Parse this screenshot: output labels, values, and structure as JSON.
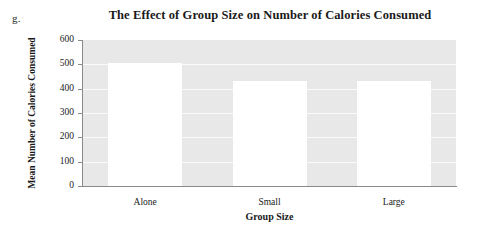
{
  "figure": {
    "item_marker": "g."
  },
  "chart_data": {
    "type": "bar",
    "title": "The Effect of Group Size on Number of Calories Consumed",
    "xlabel": "Group Size",
    "ylabel": "Mean Number of Calories Consumed",
    "categories": [
      "Alone",
      "Small",
      "Large"
    ],
    "values": [
      505,
      430,
      430
    ],
    "ylim": [
      0,
      600
    ],
    "ytick_labels": [
      "0",
      "100",
      "200",
      "300",
      "400",
      "500",
      "600"
    ],
    "ytick_values": [
      0,
      100,
      200,
      300,
      400,
      500,
      600
    ],
    "grid": true,
    "legend": "none",
    "colors": {
      "bar_fill": "#ffffff",
      "plot_background": "#e8e8e8",
      "gridline": "#fbfbfb",
      "axis_line": "#8a8a8a",
      "text": "#1a1a1a"
    }
  }
}
